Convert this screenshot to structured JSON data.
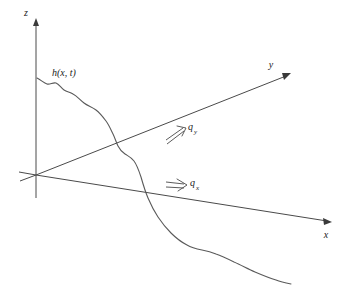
{
  "figure": {
    "type": "3d-coordinate-diagram",
    "background_color": "#ffffff",
    "line_color": "#4a4a4a",
    "curve_color": "#5a5a5a",
    "text_color": "#1a1a1a"
  },
  "axes": {
    "z": {
      "label": "z",
      "label_x": 26,
      "label_y": 16,
      "direction": "up",
      "origin": [
        36,
        175
      ],
      "tip": [
        36,
        20
      ]
    },
    "y": {
      "label": "y",
      "label_x": 271,
      "label_y": 68,
      "direction": "up-right",
      "origin": [
        36,
        175
      ],
      "tip": [
        290,
        74
      ]
    },
    "x": {
      "label": "x",
      "label_x": 326,
      "label_y": 237,
      "direction": "down-right",
      "origin": [
        36,
        175
      ],
      "tip": [
        331,
        222
      ]
    }
  },
  "curve": {
    "label": "h(x, t)",
    "label_x": 52,
    "label_y": 76,
    "description": "wavy surface profile descending from z-axis to lower right",
    "start_point": [
      37,
      78
    ],
    "end_point": [
      291,
      284
    ]
  },
  "flux_arrows": [
    {
      "name": "q-y",
      "symbol": "q",
      "subscript": "y",
      "label_x": 188,
      "label_y": 132,
      "direction": "up-right",
      "tail": [
        166,
        139
      ],
      "tip": [
        184,
        127
      ]
    },
    {
      "name": "q-x",
      "symbol": "q",
      "subscript": "x",
      "label_x": 188,
      "label_y": 186,
      "direction": "right",
      "tail": [
        166,
        187
      ],
      "tip": [
        184,
        183
      ]
    }
  ]
}
